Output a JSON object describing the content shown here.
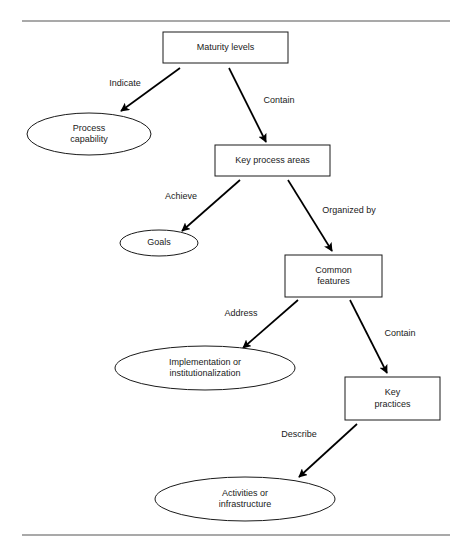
{
  "diagram": {
    "background_color": "#ffffff",
    "line_color": "#000000",
    "shape_fill": "#ffffff",
    "rule_color": "#8c8c8c",
    "rules": [
      {
        "name": "top-rule",
        "x1": 22,
        "y1": 21,
        "x2": 450,
        "y2": 21
      },
      {
        "name": "bottom-rule",
        "x1": 22,
        "y1": 535,
        "x2": 450,
        "y2": 535
      }
    ],
    "nodes": [
      {
        "id": "maturity-levels",
        "shape": "rect",
        "lines": [
          "Maturity levels"
        ],
        "x": 163,
        "y": 32,
        "w": 125,
        "h": 31,
        "cx": 225.5,
        "cy": 47.5
      },
      {
        "id": "process-capability",
        "shape": "ellipse",
        "lines": [
          "Process",
          "capability"
        ],
        "cx": 89,
        "cy": 134,
        "rx": 62,
        "ry": 21
      },
      {
        "id": "key-process-areas",
        "shape": "rect",
        "lines": [
          "Key process areas"
        ],
        "x": 215,
        "y": 145,
        "w": 115,
        "h": 31,
        "cx": 272.5,
        "cy": 160.5
      },
      {
        "id": "goals",
        "shape": "ellipse",
        "lines": [
          "Goals"
        ],
        "cx": 159,
        "cy": 243,
        "rx": 39,
        "ry": 13
      },
      {
        "id": "common-features",
        "shape": "rect",
        "lines": [
          "Common",
          "features"
        ],
        "x": 285,
        "y": 255,
        "w": 97,
        "h": 42,
        "cx": 333.5,
        "cy": 276
      },
      {
        "id": "implementation-or-institutionalization",
        "shape": "ellipse",
        "lines": [
          "Implementation or",
          "institutionalization"
        ],
        "cx": 205,
        "cy": 368,
        "rx": 90,
        "ry": 22
      },
      {
        "id": "key-practices",
        "shape": "rect",
        "lines": [
          "Key",
          "practices"
        ],
        "x": 345,
        "y": 377,
        "w": 95,
        "h": 43,
        "cx": 392.5,
        "cy": 398.5
      },
      {
        "id": "activities-or-infrastructure",
        "shape": "ellipse",
        "lines": [
          "Activities or",
          "infrastructure"
        ],
        "cx": 245,
        "cy": 499,
        "rx": 90,
        "ry": 22
      }
    ],
    "edges": [
      {
        "id": "indicate",
        "label": "Indicate",
        "from": "maturity-levels",
        "to": "process-capability",
        "x1": 180,
        "y1": 68,
        "x2": 121,
        "y2": 111,
        "label_x": 125,
        "label_y": 84
      },
      {
        "id": "contain-kpa",
        "label": "Contain",
        "from": "maturity-levels",
        "to": "key-process-areas",
        "x1": 229,
        "y1": 68,
        "x2": 266,
        "y2": 142,
        "label_x": 279,
        "label_y": 101
      },
      {
        "id": "achieve",
        "label": "Achieve",
        "from": "key-process-areas",
        "to": "goals",
        "x1": 240,
        "y1": 180,
        "x2": 182,
        "y2": 231,
        "label_x": 181,
        "label_y": 197
      },
      {
        "id": "organized-by",
        "label": "Organized by",
        "from": "key-process-areas",
        "to": "common-features",
        "x1": 288,
        "y1": 180,
        "x2": 332,
        "y2": 251,
        "label_x": 349,
        "label_y": 211
      },
      {
        "id": "address",
        "label": "Address",
        "from": "common-features",
        "to": "implementation-or-institutionalization",
        "x1": 298,
        "y1": 300,
        "x2": 243,
        "y2": 348,
        "label_x": 241,
        "label_y": 314
      },
      {
        "id": "contain-practices",
        "label": "Contain",
        "from": "common-features",
        "to": "key-practices",
        "x1": 350,
        "y1": 300,
        "x2": 387,
        "y2": 373,
        "label_x": 400,
        "label_y": 334
      },
      {
        "id": "describe",
        "label": "Describe",
        "from": "key-practices",
        "to": "activities-or-infrastructure",
        "x1": 357,
        "y1": 424,
        "x2": 299,
        "y2": 477,
        "label_x": 299,
        "label_y": 435
      }
    ]
  }
}
